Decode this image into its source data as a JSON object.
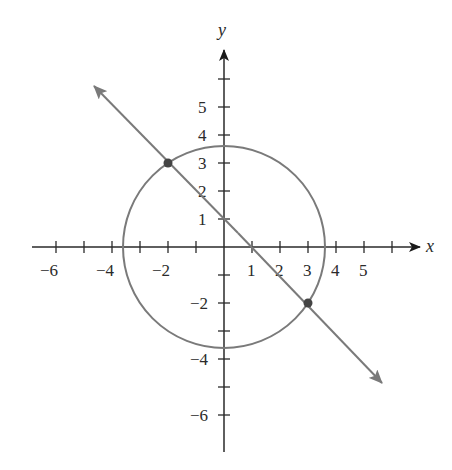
{
  "diagram": {
    "type": "coordinate-plane",
    "axes": {
      "x_label": "x",
      "y_label": "y",
      "x_ticks": [
        "−6",
        "−4",
        "−2",
        "1",
        "2",
        "3",
        "4",
        "5"
      ],
      "y_ticks": [
        "5",
        "4",
        "3",
        "2",
        "1",
        "−2",
        "−4",
        "−6"
      ],
      "x_range": [
        -6,
        6
      ],
      "y_range": [
        -7,
        6
      ]
    },
    "circle": {
      "center": [
        0,
        0
      ],
      "radius_squared": 13,
      "color": "#7a7a7a"
    },
    "line": {
      "equation": "y = -x + 1",
      "color": "#7a7a7a"
    },
    "intersection_points": [
      {
        "x": -2,
        "y": 3
      },
      {
        "x": 3,
        "y": -2
      }
    ],
    "colors": {
      "axes": "#2a2a2a",
      "curves": "#7a7a7a",
      "points": "#444444"
    }
  }
}
